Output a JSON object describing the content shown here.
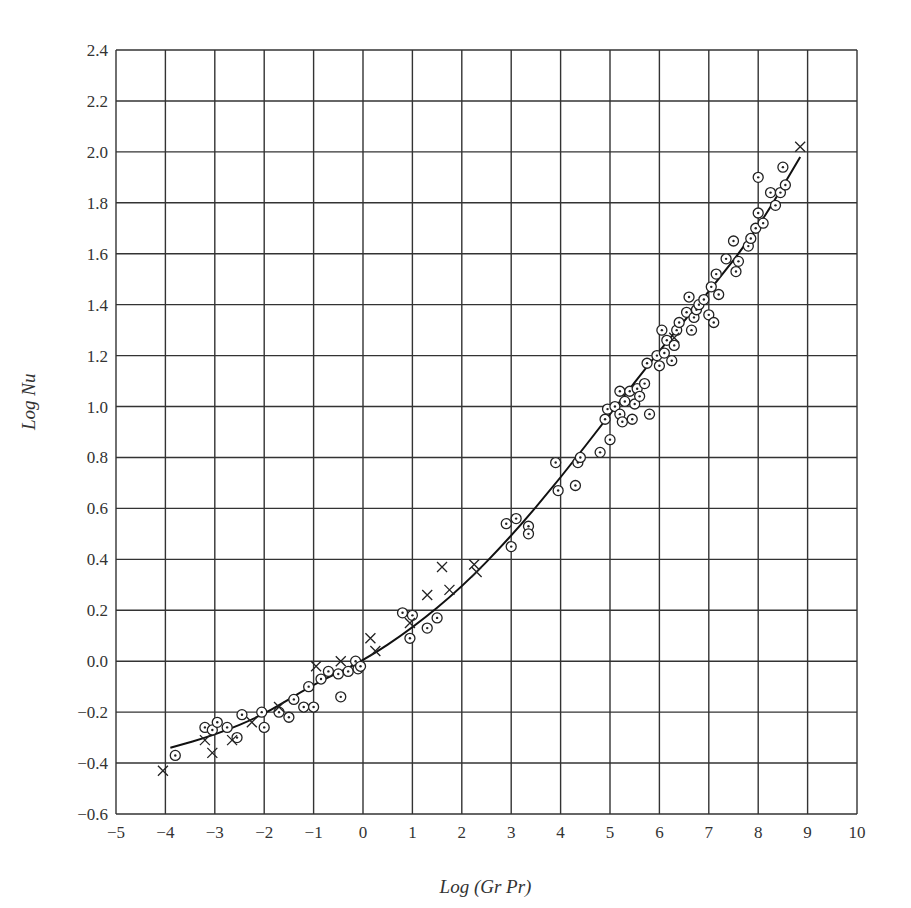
{
  "chart_data": {
    "type": "scatter",
    "title": "",
    "xlabel": "Log (Gr Pr)",
    "ylabel": "Log Nu",
    "xlim": [
      -5,
      10
    ],
    "ylim": [
      -0.6,
      2.4
    ],
    "xticks": [
      "-5",
      "-4",
      "-3",
      "-2",
      "-1",
      "0",
      "1",
      "2",
      "3",
      "4",
      "5",
      "6",
      "7",
      "8",
      "9",
      "10"
    ],
    "yticks": [
      "2.4",
      "2.2",
      "2.0",
      "1.8",
      "1.6",
      "1.4",
      "1.2",
      "1.0",
      "0.8",
      "0.6",
      "0.4",
      "0.2",
      "0.0",
      "-0.2",
      "-0.4",
      "-0.6"
    ],
    "grid": true,
    "legend": null,
    "series": [
      {
        "name": "circle-dot markers",
        "marker": "circled-dot",
        "points": [
          [
            -3.8,
            -0.37
          ],
          [
            -3.2,
            -0.26
          ],
          [
            -3.05,
            -0.27
          ],
          [
            -2.95,
            -0.24
          ],
          [
            -2.75,
            -0.26
          ],
          [
            -2.55,
            -0.3
          ],
          [
            -2.45,
            -0.21
          ],
          [
            -2.05,
            -0.2
          ],
          [
            -2.0,
            -0.26
          ],
          [
            -1.7,
            -0.2
          ],
          [
            -1.5,
            -0.22
          ],
          [
            -1.4,
            -0.15
          ],
          [
            -1.2,
            -0.18
          ],
          [
            -1.1,
            -0.1
          ],
          [
            -1.0,
            -0.18
          ],
          [
            -0.85,
            -0.07
          ],
          [
            -0.7,
            -0.04
          ],
          [
            -0.5,
            -0.05
          ],
          [
            -0.45,
            -0.14
          ],
          [
            -0.3,
            -0.04
          ],
          [
            -0.15,
            0.0
          ],
          [
            -0.1,
            -0.03
          ],
          [
            -0.05,
            -0.02
          ],
          [
            0.8,
            0.19
          ],
          [
            0.95,
            0.09
          ],
          [
            1.0,
            0.18
          ],
          [
            1.3,
            0.13
          ],
          [
            1.5,
            0.17
          ],
          [
            2.9,
            0.54
          ],
          [
            3.0,
            0.45
          ],
          [
            3.1,
            0.56
          ],
          [
            3.35,
            0.53
          ],
          [
            3.35,
            0.5
          ],
          [
            3.9,
            0.78
          ],
          [
            3.95,
            0.67
          ],
          [
            4.3,
            0.69
          ],
          [
            4.35,
            0.78
          ],
          [
            4.4,
            0.8
          ],
          [
            4.8,
            0.82
          ],
          [
            4.9,
            0.95
          ],
          [
            4.95,
            0.99
          ],
          [
            5.0,
            0.87
          ],
          [
            5.1,
            1.0
          ],
          [
            5.2,
            1.06
          ],
          [
            5.2,
            0.97
          ],
          [
            5.25,
            0.94
          ],
          [
            5.3,
            1.02
          ],
          [
            5.4,
            1.06
          ],
          [
            5.45,
            0.95
          ],
          [
            5.5,
            1.01
          ],
          [
            5.55,
            1.07
          ],
          [
            5.6,
            1.04
          ],
          [
            5.7,
            1.09
          ],
          [
            5.75,
            1.17
          ],
          [
            5.8,
            0.97
          ],
          [
            5.95,
            1.2
          ],
          [
            6.0,
            1.16
          ],
          [
            6.05,
            1.3
          ],
          [
            6.1,
            1.21
          ],
          [
            6.15,
            1.26
          ],
          [
            6.25,
            1.18
          ],
          [
            6.3,
            1.24
          ],
          [
            6.35,
            1.3
          ],
          [
            6.4,
            1.33
          ],
          [
            6.55,
            1.37
          ],
          [
            6.6,
            1.43
          ],
          [
            6.65,
            1.3
          ],
          [
            6.7,
            1.35
          ],
          [
            6.75,
            1.38
          ],
          [
            6.8,
            1.4
          ],
          [
            6.9,
            1.42
          ],
          [
            7.0,
            1.36
          ],
          [
            7.05,
            1.47
          ],
          [
            7.1,
            1.33
          ],
          [
            7.15,
            1.52
          ],
          [
            7.2,
            1.44
          ],
          [
            7.35,
            1.58
          ],
          [
            7.5,
            1.65
          ],
          [
            7.55,
            1.53
          ],
          [
            7.6,
            1.57
          ],
          [
            7.8,
            1.63
          ],
          [
            7.85,
            1.66
          ],
          [
            7.95,
            1.7
          ],
          [
            8.0,
            1.76
          ],
          [
            8.0,
            1.9
          ],
          [
            8.1,
            1.72
          ],
          [
            8.25,
            1.84
          ],
          [
            8.35,
            1.79
          ],
          [
            8.45,
            1.84
          ],
          [
            8.5,
            1.94
          ],
          [
            8.55,
            1.87
          ]
        ]
      },
      {
        "name": "cross markers",
        "marker": "x",
        "points": [
          [
            -4.05,
            -0.43
          ],
          [
            -3.2,
            -0.31
          ],
          [
            -3.05,
            -0.36
          ],
          [
            -2.65,
            -0.31
          ],
          [
            -2.25,
            -0.24
          ],
          [
            -1.7,
            -0.18
          ],
          [
            -0.95,
            -0.02
          ],
          [
            -0.45,
            0.0
          ],
          [
            0.15,
            0.09
          ],
          [
            0.25,
            0.04
          ],
          [
            0.95,
            0.15
          ],
          [
            1.3,
            0.26
          ],
          [
            1.6,
            0.37
          ],
          [
            1.75,
            0.28
          ],
          [
            2.25,
            0.38
          ],
          [
            2.3,
            0.35
          ],
          [
            6.3,
            1.27
          ],
          [
            8.85,
            2.02
          ]
        ]
      },
      {
        "name": "fit curve",
        "type": "line",
        "points": [
          [
            -3.9,
            -0.34
          ],
          [
            -3,
            -0.29
          ],
          [
            -2,
            -0.21
          ],
          [
            -1,
            -0.09
          ],
          [
            0,
            0.0
          ],
          [
            1,
            0.13
          ],
          [
            2,
            0.29
          ],
          [
            3,
            0.49
          ],
          [
            4,
            0.72
          ],
          [
            5,
            0.97
          ],
          [
            6,
            1.22
          ],
          [
            7,
            1.45
          ],
          [
            8,
            1.7
          ],
          [
            8.85,
            1.98
          ]
        ]
      }
    ]
  }
}
